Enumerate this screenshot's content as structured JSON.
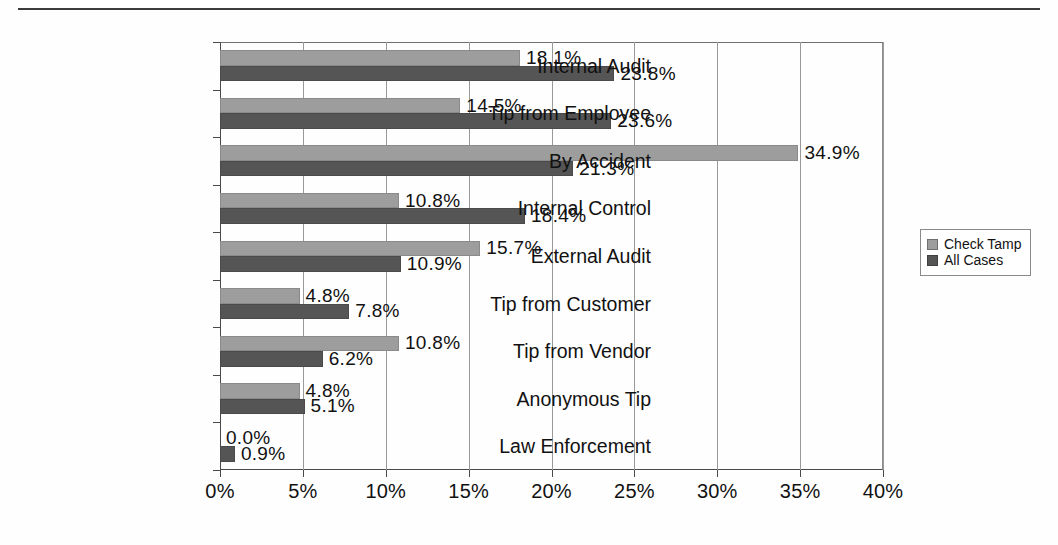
{
  "chart_data": {
    "type": "bar",
    "orientation": "horizontal",
    "title": "",
    "xlabel": "",
    "ylabel": "",
    "xlim": [
      0,
      40
    ],
    "xtick_labels": [
      "0%",
      "5%",
      "10%",
      "15%",
      "20%",
      "25%",
      "30%",
      "35%",
      "40%"
    ],
    "xticks": [
      0,
      5,
      10,
      15,
      20,
      25,
      30,
      35,
      40
    ],
    "grid": true,
    "legend_position": "right",
    "categories": [
      "Internal Audit",
      "Tip from Employee",
      "By Accident",
      "Internal Control",
      "External Audit",
      "Tip from Customer",
      "Tip from Vendor",
      "Anonymous Tip",
      "Law Enforcement"
    ],
    "series": [
      {
        "name": "Check Tamp",
        "color": "#9d9d9d",
        "values": [
          18.1,
          14.5,
          34.9,
          10.8,
          15.7,
          4.8,
          10.8,
          4.8,
          0.0
        ],
        "labels": [
          "18.1%",
          "14.5%",
          "34.9%",
          "10.8%",
          "15.7%",
          "4.8%",
          "10.8%",
          "4.8%",
          "0.0%"
        ]
      },
      {
        "name": "All Cases",
        "color": "#555555",
        "values": [
          23.8,
          23.6,
          21.3,
          18.4,
          10.9,
          7.8,
          6.2,
          5.1,
          0.9
        ],
        "labels": [
          "23.8%",
          "23.6%",
          "21.3%",
          "18.4%",
          "10.9%",
          "7.8%",
          "6.2%",
          "5.1%",
          "0.9%"
        ]
      }
    ]
  },
  "legend": {
    "items": [
      {
        "label": "Check Tamp"
      },
      {
        "label": "All Cases"
      }
    ]
  }
}
